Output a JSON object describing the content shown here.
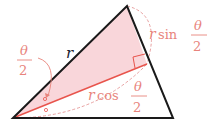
{
  "diagram": {
    "colors": {
      "outline": "#1a1a1a",
      "accent": "#e8544c",
      "label": "#e8847c",
      "shade": "#f9d6da",
      "dash": "#e8a0a0"
    },
    "labels": {
      "side_r": "r",
      "half_angle": {
        "numerator": "θ",
        "denominator": "2"
      },
      "opposite": {
        "prefix_var": "r",
        "func": "sin",
        "numerator": "θ",
        "denominator": "2"
      },
      "adjacent": {
        "prefix_var": "r",
        "func": "cos",
        "numerator": "θ",
        "denominator": "2"
      }
    }
  }
}
